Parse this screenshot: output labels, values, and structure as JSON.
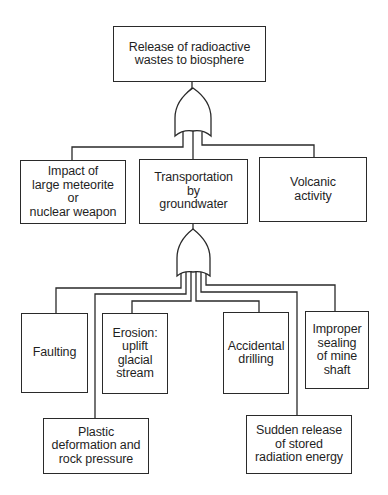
{
  "diagram": {
    "type": "fault-tree",
    "top_event": {
      "label": "Release of radioactive\nwastes to biosphere"
    },
    "gates": [
      {
        "id": "gate-1",
        "type": "OR",
        "parent": "top_event"
      },
      {
        "id": "gate-2",
        "type": "OR",
        "parent": "transportation"
      }
    ],
    "level_1": [
      {
        "id": "impact",
        "label": "Impact of\nlarge meteorite\nor\nnuclear weapon"
      },
      {
        "id": "transportation",
        "label": "Transportation\nby\ngroundwater"
      },
      {
        "id": "volcanic",
        "label": "Volcanic\nactivity"
      }
    ],
    "level_2": [
      {
        "id": "faulting",
        "label": "Faulting"
      },
      {
        "id": "erosion",
        "label": "Erosion:\nuplift\nglacial\nstream"
      },
      {
        "id": "drilling",
        "label": "Accidental\ndrilling"
      },
      {
        "id": "sealing",
        "label": "Improper\nsealing\nof mine\nshaft"
      }
    ],
    "level_3": [
      {
        "id": "plastic",
        "label": "Plastic\ndeformation and\nrock pressure"
      },
      {
        "id": "sudden",
        "label": "Sudden release\nof stored\nradiation energy"
      }
    ]
  }
}
